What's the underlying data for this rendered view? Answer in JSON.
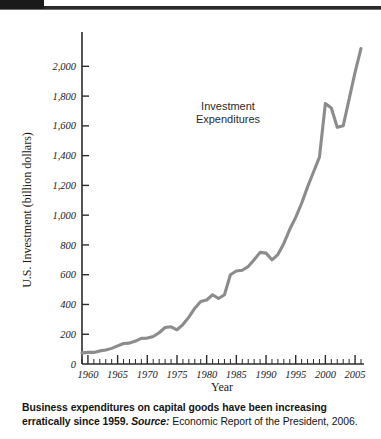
{
  "chart_data": {
    "type": "line",
    "title": "",
    "xlabel": "Year",
    "ylabel": "U.S. Investment (billion dollars)",
    "xlim": [
      1959,
      2006
    ],
    "ylim": [
      0,
      2150
    ],
    "grid": false,
    "legend_position": "inline-annotation",
    "series": [
      {
        "name": "Investment Expenditures",
        "x": [
          1959,
          1960,
          1961,
          1962,
          1963,
          1964,
          1965,
          1966,
          1967,
          1968,
          1969,
          1970,
          1971,
          1972,
          1973,
          1974,
          1975,
          1976,
          1977,
          1978,
          1979,
          1980,
          1981,
          1982,
          1983,
          1984,
          1985,
          1986,
          1987,
          1988,
          1989,
          1990,
          1991,
          1992,
          1993,
          1994,
          1995,
          1996,
          1997,
          1998,
          1999,
          2000,
          2001,
          2002,
          2003,
          2004,
          2005,
          2006
        ],
        "values": [
          75,
          78,
          78,
          88,
          94,
          105,
          122,
          138,
          140,
          154,
          172,
          174,
          185,
          210,
          245,
          250,
          230,
          265,
          315,
          375,
          420,
          430,
          465,
          440,
          465,
          600,
          625,
          630,
          655,
          700,
          750,
          745,
          700,
          735,
          810,
          905,
          985,
          1080,
          1190,
          1290,
          1390,
          1750,
          1720,
          1590,
          1600,
          1780,
          1960,
          2120
        ]
      }
    ],
    "y_ticks": [
      0,
      200,
      400,
      600,
      800,
      1000,
      1200,
      1400,
      1600,
      1800,
      2000
    ],
    "y_tick_labels": [
      "0",
      "200",
      "400",
      "600",
      "800",
      "1,000",
      "1,200",
      "1,400",
      "1,600",
      "1,800",
      "2,000"
    ],
    "x_ticks": [
      1960,
      1965,
      1970,
      1975,
      1980,
      1985,
      1990,
      1995,
      2000,
      2005
    ],
    "x_tick_labels": [
      "1960",
      "1965",
      "1970",
      "1975",
      "1980",
      "1985",
      "1990",
      "1995",
      "2000",
      "2005"
    ],
    "x_minor_step": 1,
    "annotations": [
      {
        "text_line1": "Investment",
        "text_line2": "Expenditures",
        "x": 1991,
        "y": 1560
      }
    ],
    "colors": {
      "line": "#8c8c8c",
      "axis": "#2b2b2b",
      "text": "#1b1b1b",
      "background": "#ffffff"
    }
  },
  "caption": {
    "lead": "Business expenditures on capital goods have been increasing erratically since 1959.",
    "source_label": "Source:",
    "source_text": "Economic Report of the President, 2006."
  }
}
